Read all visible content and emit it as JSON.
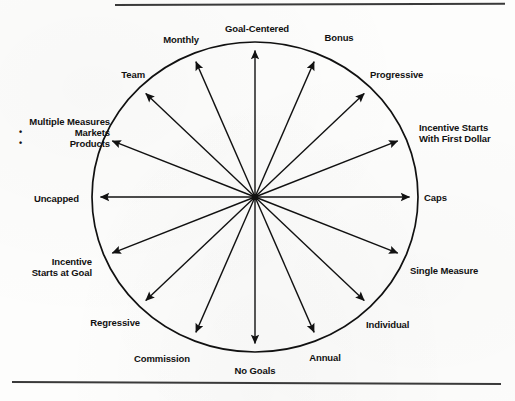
{
  "figure": {
    "type": "radial-wheel-diagram",
    "spoke_count": 16,
    "center": {
      "x": 255,
      "y": 197
    },
    "radius": {
      "x": 163,
      "y": 155
    },
    "stroke_color": "#111111",
    "background_color": "#fdfdfc",
    "rules": {
      "top_label": "top-horizontal-rule",
      "bottom_label": "bottom-horizontal-rule"
    }
  },
  "chart_data": {
    "type": "radial",
    "title": "",
    "spokes": [
      {
        "angle_deg": 0,
        "label": "Goal-Centered"
      },
      {
        "angle_deg": 22.5,
        "label": "Bonus"
      },
      {
        "angle_deg": 45,
        "label": "Progressive"
      },
      {
        "angle_deg": 67.5,
        "label": "Incentive Starts With First Dollar"
      },
      {
        "angle_deg": 90,
        "label": "Caps"
      },
      {
        "angle_deg": 112.5,
        "label": "Single Measure"
      },
      {
        "angle_deg": 135,
        "label": "Individual"
      },
      {
        "angle_deg": 157.5,
        "label": "Annual"
      },
      {
        "angle_deg": 180,
        "label": "No Goals"
      },
      {
        "angle_deg": 202.5,
        "label": "Commission"
      },
      {
        "angle_deg": 225,
        "label": "Regressive"
      },
      {
        "angle_deg": 247.5,
        "label": "Incentive Starts at Goal"
      },
      {
        "angle_deg": 270,
        "label": "Uncapped"
      },
      {
        "angle_deg": 292.5,
        "label": "Multiple Measures"
      },
      {
        "angle_deg": 315,
        "label": "Team"
      },
      {
        "angle_deg": 337.5,
        "label": "Monthly"
      }
    ]
  },
  "labels": {
    "goal_centered": "Goal-Centered",
    "bonus": "Bonus",
    "progressive": "Progressive",
    "incentive_starts_first_dollar_line1": "Incentive Starts",
    "incentive_starts_first_dollar_line2": "With First Dollar",
    "caps": "Caps",
    "single_measure": "Single Measure",
    "individual": "Individual",
    "annual": "Annual",
    "no_goals": "No Goals",
    "commission": "Commission",
    "regressive": "Regressive",
    "incentive_starts_at_goal_line1": "Incentive",
    "incentive_starts_at_goal_line2": "Starts at Goal",
    "uncapped": "Uncapped",
    "multiple_measures_title": "Multiple Measures",
    "multiple_measures_bullet1": "Markets",
    "multiple_measures_bullet2": "Products",
    "team": "Team",
    "monthly": "Monthly"
  }
}
